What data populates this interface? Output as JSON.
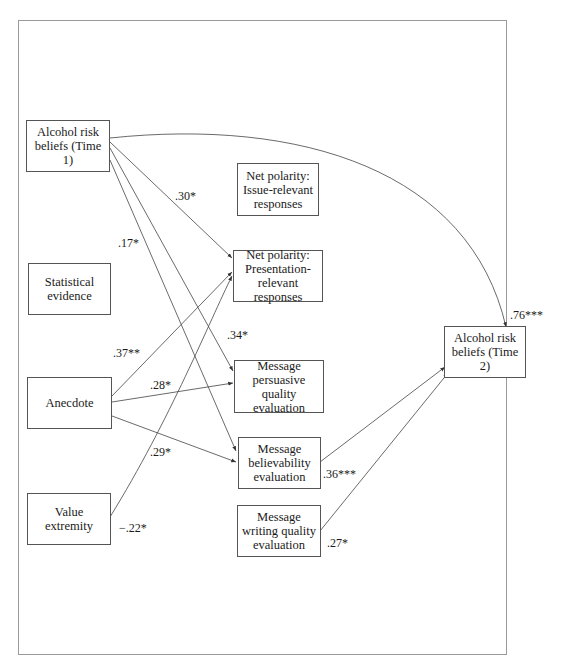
{
  "diagram": {
    "type": "path-model",
    "nodes": {
      "arb1": {
        "lines": [
          "Alcohol risk",
          "beliefs (Time 1)"
        ]
      },
      "stat": {
        "lines": [
          "Statistical",
          "evidence"
        ]
      },
      "anec": {
        "lines": [
          "Anecdote"
        ]
      },
      "valx": {
        "lines": [
          "Value extremity"
        ]
      },
      "npir": {
        "lines": [
          "Net polarity:",
          "Issue-relevant",
          "responses"
        ]
      },
      "nppr": {
        "lines": [
          "Net polarity:",
          "Presentation-",
          "relevant responses"
        ]
      },
      "mpqe": {
        "lines": [
          "Message",
          "persuasive",
          "quality evaluation"
        ]
      },
      "mbe": {
        "lines": [
          "Message",
          "believability",
          "evaluation"
        ]
      },
      "mwqe": {
        "lines": [
          "Message",
          "writing quality",
          "evaluation"
        ]
      },
      "arb2": {
        "lines": [
          "Alcohol risk",
          "beliefs (Time 2)"
        ]
      }
    },
    "coefficients": {
      "arb1_nppr": ".30*",
      "arb1_mbe": ".17*",
      "arb1_mpqe": ".34*",
      "anec_nppr": ".37**",
      "anec_mpqe": ".28*",
      "anec_mbe": ".29*",
      "valx_nppr": "−.22*",
      "arb1_arb2": ".76***",
      "mbe_arb2": ".36***",
      "mwqe_arb2": ".27*"
    },
    "edges": [
      {
        "from": "Alcohol risk beliefs (Time 1)",
        "to": "Net polarity: Presentation-relevant responses",
        "label": ".30*"
      },
      {
        "from": "Alcohol risk beliefs (Time 1)",
        "to": "Message persuasive quality evaluation",
        "label": ".34*"
      },
      {
        "from": "Alcohol risk beliefs (Time 1)",
        "to": "Message believability evaluation",
        "label": ".17*"
      },
      {
        "from": "Alcohol risk beliefs (Time 1)",
        "to": "Alcohol risk beliefs (Time 2)",
        "label": ".76***"
      },
      {
        "from": "Anecdote",
        "to": "Net polarity: Presentation-relevant responses",
        "label": ".37**"
      },
      {
        "from": "Anecdote",
        "to": "Message persuasive quality evaluation",
        "label": ".28*"
      },
      {
        "from": "Anecdote",
        "to": "Message believability evaluation",
        "label": ".29*"
      },
      {
        "from": "Value extremity",
        "to": "Net polarity: Presentation-relevant responses",
        "label": "−.22*"
      },
      {
        "from": "Message believability evaluation",
        "to": "Alcohol risk beliefs (Time 2)",
        "label": ".36***"
      },
      {
        "from": "Message writing quality evaluation",
        "to": "Alcohol risk beliefs (Time 2)",
        "label": ".27*"
      }
    ],
    "colors": {
      "line": "#444444",
      "border": "#555555",
      "frame": "#9a9a9a"
    }
  }
}
